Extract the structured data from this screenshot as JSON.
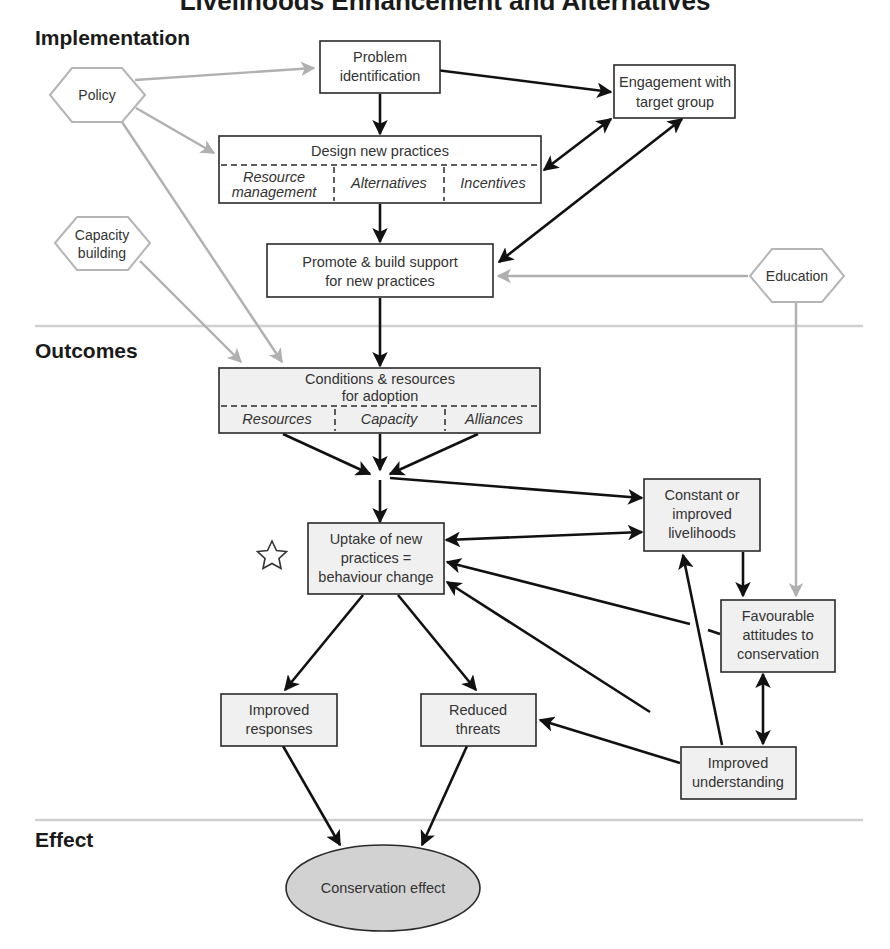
{
  "title": "Livelihoods Enhancement and Alternatives",
  "sections": {
    "implementation": "Implementation",
    "outcomes": "Outcomes",
    "effect": "Effect"
  },
  "colors": {
    "black_arrow": "#111111",
    "gray_arrow": "#b0b0b0",
    "outcome_fill": "#f0f0f0",
    "effect_fill": "#d2d2d2",
    "separator": "#d0d0d0"
  },
  "hexagons": {
    "policy": "Policy",
    "capacity_building": [
      "Capacity",
      "building"
    ],
    "education": "Education"
  },
  "implementation_boxes": {
    "problem_identification": [
      "Problem",
      "identification"
    ],
    "engagement": [
      "Engagement with",
      "target group"
    ],
    "design": {
      "title": "Design new practices",
      "sub": {
        "resource_management": [
          "Resource",
          "management"
        ],
        "alternatives": "Alternatives",
        "incentives": "Incentives"
      }
    },
    "promote": [
      "Promote & build support",
      "for new practices"
    ]
  },
  "outcome_boxes": {
    "conditions": {
      "title": [
        "Conditions & resources",
        "for adoption"
      ],
      "sub": {
        "resources": "Resources",
        "capacity": "Capacity",
        "alliances": "Alliances"
      }
    },
    "uptake": [
      "Uptake of new",
      "practices =",
      "behaviour change"
    ],
    "livelihoods": [
      "Constant or",
      "improved",
      "livelihoods"
    ],
    "attitudes": [
      "Favourable",
      "attitudes to",
      "conservation"
    ],
    "improved_responses": [
      "Improved",
      "responses"
    ],
    "reduced_threats": [
      "Reduced",
      "threats"
    ],
    "understanding": [
      "Improved",
      "understanding"
    ]
  },
  "effect": {
    "conservation_effect": "Conservation effect"
  },
  "markers": {
    "uptake_star": "star-icon"
  }
}
